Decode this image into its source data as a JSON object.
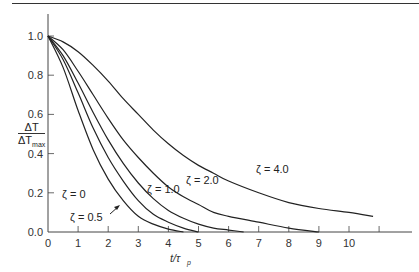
{
  "chart_data": {
    "type": "line",
    "title": "",
    "xlabel": "t/τp",
    "ylabel": "ΔT / ΔTmax",
    "xlim": [
      0,
      11
    ],
    "ylim": [
      0,
      1.1
    ],
    "x_ticks": [
      "0",
      "1",
      "2",
      "3",
      "4",
      "5",
      "6",
      "7",
      "8",
      "9",
      "10"
    ],
    "y_ticks": [
      "0.0",
      "0.2",
      "0.4",
      "0.6",
      "0.8",
      "1.0"
    ],
    "grid": false,
    "legend": "inline labels",
    "series": [
      {
        "name": "ζ = 0",
        "label": "ζ = 0",
        "x": [
          0,
          0.5,
          1,
          1.5,
          2,
          2.5,
          3,
          3.5,
          4,
          4.5
        ],
        "y": [
          1.0,
          0.84,
          0.62,
          0.42,
          0.27,
          0.16,
          0.08,
          0.04,
          0.015,
          0.0
        ]
      },
      {
        "name": "ζ = 0.5",
        "label": "ζ = 0.5",
        "x": [
          0,
          0.5,
          1,
          1.5,
          2,
          2.5,
          3,
          3.5,
          4,
          4.5,
          5
        ],
        "y": [
          1.0,
          0.88,
          0.71,
          0.53,
          0.38,
          0.26,
          0.16,
          0.09,
          0.05,
          0.02,
          0.0
        ]
      },
      {
        "name": "ζ = 1.0",
        "label": "ζ = 1.0",
        "x": [
          0,
          0.5,
          1,
          1.5,
          2,
          2.5,
          3,
          3.5,
          4,
          4.5,
          5,
          5.5,
          6,
          6.5
        ],
        "y": [
          1.0,
          0.9,
          0.76,
          0.61,
          0.47,
          0.35,
          0.25,
          0.17,
          0.11,
          0.07,
          0.04,
          0.02,
          0.01,
          0.0
        ]
      },
      {
        "name": "ζ = 2.0",
        "label": "ζ = 2.0",
        "x": [
          0,
          0.5,
          1,
          1.5,
          2,
          2.5,
          3,
          3.5,
          4,
          4.5,
          5,
          5.5,
          6,
          7,
          8,
          9
        ],
        "y": [
          1.0,
          0.93,
          0.82,
          0.7,
          0.58,
          0.47,
          0.38,
          0.3,
          0.23,
          0.18,
          0.14,
          0.1,
          0.08,
          0.05,
          0.02,
          0.0
        ]
      },
      {
        "name": "ζ = 4.0",
        "label": "ζ = 4.0",
        "x": [
          0,
          0.5,
          1,
          1.5,
          2,
          2.5,
          3,
          3.5,
          4,
          4.5,
          5,
          5.5,
          6,
          7,
          8,
          9,
          10,
          10.8
        ],
        "y": [
          1.0,
          0.97,
          0.92,
          0.85,
          0.77,
          0.68,
          0.6,
          0.52,
          0.45,
          0.39,
          0.34,
          0.3,
          0.26,
          0.2,
          0.15,
          0.12,
          0.1,
          0.08
        ]
      }
    ],
    "annotations": [
      {
        "text": "ζ = 0",
        "at_series": "ζ = 0"
      },
      {
        "text": "ζ = 0.5",
        "arrow": true,
        "at_series": "ζ = 0.5"
      },
      {
        "text": "ζ = 1.0",
        "at_series": "ζ = 1.0"
      },
      {
        "text": "ζ = 2.0",
        "at_series": "ζ = 2.0"
      },
      {
        "text": "ζ = 4.0",
        "at_series": "ζ = 4.0"
      }
    ]
  },
  "axes": {
    "ylabel_num": "ΔT",
    "ylabel_den": "ΔT",
    "ylabel_den_sub": "max",
    "xlabel_t": "t/τ",
    "xlabel_sub": "p"
  },
  "style": {
    "line_color": "#222222",
    "axis_color": "#444444"
  }
}
